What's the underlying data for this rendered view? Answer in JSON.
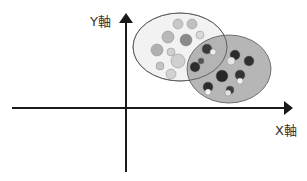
{
  "axes": {
    "x_label": "X軸",
    "y_label": "Y軸"
  },
  "colors": {
    "axis": "#1a1a1a",
    "cluster_light_fill": "#f0f0f0",
    "cluster_dark_fill": "#a8a8a8",
    "cluster_stroke": "#555555"
  },
  "clusters": [
    {
      "name": "light-fruits",
      "description": "oranges, peaches, cherries, bananas (light colored fruits)",
      "items": [
        {
          "x": 178,
          "y": 24,
          "r": 5,
          "shade": "#c8c8c8"
        },
        {
          "x": 192,
          "y": 24,
          "r": 5,
          "shade": "#c0c0c0"
        },
        {
          "x": 168,
          "y": 37,
          "r": 6,
          "shade": "#b8b8b8"
        },
        {
          "x": 186,
          "y": 40,
          "r": 6,
          "shade": "#8a8a8a"
        },
        {
          "x": 200,
          "y": 35,
          "r": 4,
          "shade": "#d8d8d8"
        },
        {
          "x": 157,
          "y": 50,
          "r": 6,
          "shade": "#b0b0b0"
        },
        {
          "x": 171,
          "y": 52,
          "r": 4,
          "shade": "#d0d0d0"
        },
        {
          "x": 178,
          "y": 61,
          "r": 7,
          "shade": "#cfcfcf"
        },
        {
          "x": 160,
          "y": 66,
          "r": 4,
          "shade": "#c4c4c4"
        },
        {
          "x": 171,
          "y": 74,
          "r": 5,
          "shade": "#d2d2d2"
        }
      ]
    },
    {
      "name": "dark-fruits",
      "description": "apples, dark fruits",
      "items": [
        {
          "x": 207,
          "y": 49,
          "r": 5,
          "shade": "#3a3a3a"
        },
        {
          "x": 213,
          "y": 52,
          "r": 3,
          "shade": "#eeeeee"
        },
        {
          "x": 195,
          "y": 67,
          "r": 5,
          "shade": "#2e2e2e"
        },
        {
          "x": 201,
          "y": 61,
          "r": 3,
          "shade": "#555555"
        },
        {
          "x": 235,
          "y": 55,
          "r": 5,
          "shade": "#2a2a2a"
        },
        {
          "x": 231,
          "y": 61,
          "r": 4,
          "shade": "#e6e6e6"
        },
        {
          "x": 249,
          "y": 61,
          "r": 5,
          "shade": "#303030"
        },
        {
          "x": 222,
          "y": 76,
          "r": 6,
          "shade": "#262626"
        },
        {
          "x": 240,
          "y": 75,
          "r": 5,
          "shade": "#333333"
        },
        {
          "x": 240,
          "y": 81,
          "r": 3,
          "shade": "#f2f2f2"
        },
        {
          "x": 208,
          "y": 87,
          "r": 5,
          "shade": "#2c2c2c"
        },
        {
          "x": 208,
          "y": 92,
          "r": 3,
          "shade": "#f4f4f4"
        },
        {
          "x": 230,
          "y": 90,
          "r": 4,
          "shade": "#3c3c3c"
        },
        {
          "x": 228,
          "y": 93,
          "r": 3,
          "shade": "#e0e0e0"
        }
      ]
    }
  ]
}
